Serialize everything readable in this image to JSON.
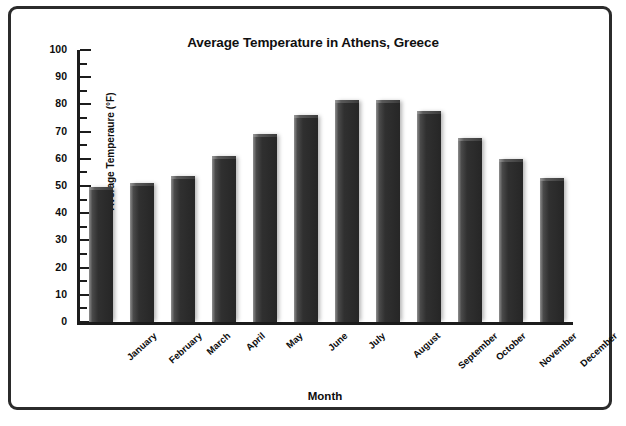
{
  "chart_data": {
    "type": "bar",
    "title": "Average Temperature in Athens, Greece",
    "xlabel": "Month",
    "ylabel": "Average Temperaure (°F)",
    "categories": [
      "January",
      "February",
      "March",
      "April",
      "May",
      "June",
      "July",
      "August",
      "September",
      "October",
      "November",
      "December"
    ],
    "values": [
      49.5,
      51,
      53.5,
      61,
      69,
      76,
      81.5,
      81.5,
      77.5,
      67.5,
      60,
      53
    ],
    "ylim": [
      0,
      100
    ],
    "y_major_ticks": [
      0,
      10,
      20,
      30,
      40,
      50,
      60,
      70,
      80,
      90,
      100
    ],
    "y_minor_interval": 5,
    "grid": false,
    "legend": "none",
    "series": [
      {
        "name": "Average Temperature",
        "values": [
          49.5,
          51,
          53.5,
          61,
          69,
          76,
          81.5,
          81.5,
          77.5,
          67.5,
          60,
          53
        ]
      }
    ]
  },
  "style": {
    "bar_color": "#2e2e2e",
    "axis_color": "#1c1c1c",
    "border_color": "#2b2b2b",
    "background": "#ffffff"
  }
}
